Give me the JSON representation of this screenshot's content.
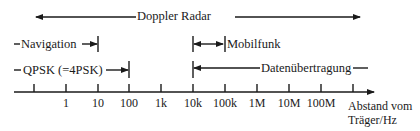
{
  "diagram": {
    "type": "frequency-range-diagram",
    "axis": {
      "title_line1": "Abstand vom",
      "title_line2": "Träger/Hz",
      "ticks": [
        "",
        "1",
        "10",
        "100",
        "1k",
        "10k",
        "100k",
        "1M",
        "10M",
        "100M",
        ""
      ]
    },
    "ranges": [
      {
        "id": "doppler",
        "label": "Doppler Radar",
        "from": "0.1",
        "to": "1G"
      },
      {
        "id": "navigation",
        "label": "Navigation",
        "from": "0.1",
        "to": "10"
      },
      {
        "id": "mobilfunk",
        "label": "Mobilfunk",
        "from": "10k",
        "to": "100k"
      },
      {
        "id": "qpsk",
        "label": "QPSK (=4PSK)",
        "from": "0.1",
        "to": "100"
      },
      {
        "id": "daten",
        "label": "Datenübertragung",
        "from": "10k",
        "to": "1G"
      }
    ],
    "colors": {
      "ink": "#1a1a1a",
      "background": "#ffffff"
    }
  }
}
